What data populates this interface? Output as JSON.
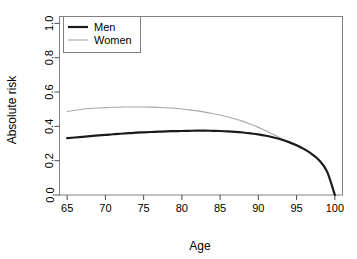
{
  "chart_data": {
    "type": "line",
    "title": "",
    "subtitle": "",
    "xlabel": "Age",
    "ylabel": "Absolute risk",
    "xlim": [
      64,
      101
    ],
    "ylim": [
      0.0,
      1.04
    ],
    "grid": false,
    "legend_position": "top-left",
    "xticks": [
      65,
      70,
      75,
      80,
      85,
      90,
      95,
      100
    ],
    "xtick_labels": [
      "65",
      "70",
      "75",
      "80",
      "85",
      "90",
      "95",
      "100"
    ],
    "yticks": [
      0.0,
      0.2,
      0.4,
      0.6,
      0.8,
      1.0
    ],
    "ytick_labels": [
      "0.0",
      "0.2",
      "0.4",
      "0.6",
      "0.8",
      "1.0"
    ],
    "x": [
      65,
      66,
      67,
      68,
      69,
      70,
      71,
      72,
      73,
      74,
      75,
      76,
      77,
      78,
      79,
      80,
      81,
      82,
      83,
      84,
      85,
      86,
      87,
      88,
      89,
      90,
      91,
      92,
      93,
      94,
      95,
      96,
      97,
      98,
      99,
      100
    ],
    "series": [
      {
        "name": "Men",
        "color": "#1a1a1a",
        "width": 2.2,
        "values": [
          0.331,
          0.335,
          0.339,
          0.343,
          0.347,
          0.35,
          0.354,
          0.357,
          0.36,
          0.363,
          0.365,
          0.367,
          0.369,
          0.371,
          0.372,
          0.373,
          0.374,
          0.375,
          0.375,
          0.374,
          0.373,
          0.371,
          0.368,
          0.364,
          0.359,
          0.353,
          0.345,
          0.335,
          0.323,
          0.308,
          0.29,
          0.267,
          0.238,
          0.2,
          0.135,
          0.0
        ]
      },
      {
        "name": "Women",
        "color": "#a8a8a8",
        "width": 1.1,
        "values": [
          0.487,
          0.494,
          0.5,
          0.504,
          0.507,
          0.509,
          0.511,
          0.512,
          0.513,
          0.513,
          0.513,
          0.512,
          0.51,
          0.508,
          0.505,
          0.501,
          0.496,
          0.49,
          0.483,
          0.475,
          0.466,
          0.455,
          0.443,
          0.429,
          0.412,
          0.394,
          0.374,
          0.352,
          0.329,
          0.308,
          0.29,
          0.267,
          0.238,
          0.2,
          0.135,
          0.0
        ]
      }
    ],
    "legend": [
      {
        "label": "Men",
        "color": "#1a1a1a",
        "width": 2.2
      },
      {
        "label": "Women",
        "color": "#a8a8a8",
        "width": 1.1
      }
    ]
  }
}
